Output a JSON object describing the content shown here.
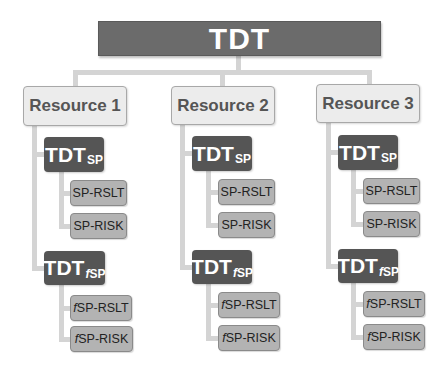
{
  "root": {
    "label": "TDT"
  },
  "resources": [
    {
      "label": "Resource 1",
      "groups": [
        {
          "main": "TDT",
          "sub_prefix": "",
          "sub": "SP",
          "leaves": [
            {
              "prefix": "",
              "label": "SP-RSLT"
            },
            {
              "prefix": "",
              "label": "SP-RISK"
            }
          ]
        },
        {
          "main": "TDT",
          "sub_prefix": "f",
          "sub": "SP",
          "leaves": [
            {
              "prefix": "f",
              "label": "SP-RSLT"
            },
            {
              "prefix": "f",
              "label": "SP-RISK"
            }
          ]
        }
      ]
    },
    {
      "label": "Resource 2",
      "groups": [
        {
          "main": "TDT",
          "sub_prefix": "",
          "sub": "SP",
          "leaves": [
            {
              "prefix": "",
              "label": "SP-RSLT"
            },
            {
              "prefix": "",
              "label": "SP-RISK"
            }
          ]
        },
        {
          "main": "TDT",
          "sub_prefix": "f",
          "sub": "SP",
          "leaves": [
            {
              "prefix": "f",
              "label": "SP-RSLT"
            },
            {
              "prefix": "f",
              "label": "SP-RISK"
            }
          ]
        }
      ]
    },
    {
      "label": "Resource 3",
      "groups": [
        {
          "main": "TDT",
          "sub_prefix": "",
          "sub": "SP",
          "leaves": [
            {
              "prefix": "",
              "label": "SP-RSLT"
            },
            {
              "prefix": "",
              "label": "SP-RISK"
            }
          ]
        },
        {
          "main": "TDT",
          "sub_prefix": "f",
          "sub": "SP",
          "leaves": [
            {
              "prefix": "f",
              "label": "SP-RSLT"
            },
            {
              "prefix": "f",
              "label": "SP-RISK"
            }
          ]
        }
      ]
    }
  ],
  "colors": {
    "root": "#6b6b6b",
    "resource": "#ececec",
    "tdt": "#555555",
    "leaf": "#b3b3b3",
    "connector": "#d4d4d4"
  }
}
